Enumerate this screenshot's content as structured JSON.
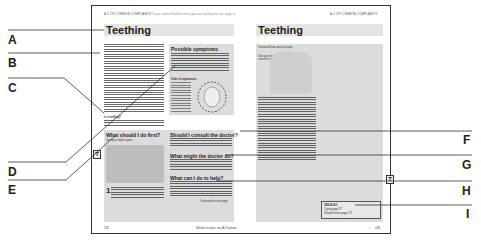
{
  "diagram": {
    "left_page": {
      "running_head": "A-Z OF COMMON COMPLAINTS",
      "running_head_note": "If you cannot find the entry you are looking for see page iii",
      "title": "Teething",
      "intro_text": "Teething is the term used to describe the eruption of a baby's first teeth. Teething usually begins at about the age of six or seven months...",
      "symptoms_box": {
        "heading": "Possible symptoms",
        "items": [
          "Increased saliva and dribbling",
          "Desire to bite on any hard object",
          "Irritability and increased grumpiness",
          "Sleeplessness",
          "Swollen red area where the tooth is coming"
        ],
        "chart_heading": "Order of appearance"
      },
      "first_aid_heading": "What should I do first?",
      "first_aid_caption": "Give your baby's gums...",
      "step_number": "1",
      "consult_heading": "Should I consult the doctor?",
      "doctor_heading": "What might the doctor do?",
      "help_heading": "What can I do to help?",
      "continued": "Continued on next page",
      "page_number": "232",
      "footer_note": "Words in italics are A-Z entries",
      "thumb_tab": "T"
    },
    "right_page": {
      "running_head": "A-Z OF COMMON COMPLAINTS",
      "title": "Teething",
      "continued_from": "Continued from previous page",
      "caption": "Give your child a carrot to chew",
      "see_also": {
        "heading": "SEE ALSO:",
        "items": [
          "Crying page 97",
          "Sleeplessness page 217"
        ]
      },
      "page_number": "233",
      "thumb_tab": "T"
    },
    "callouts": {
      "left": [
        "A",
        "B",
        "C",
        "D",
        "E"
      ],
      "right": [
        "F",
        "G",
        "H",
        "I"
      ]
    }
  }
}
